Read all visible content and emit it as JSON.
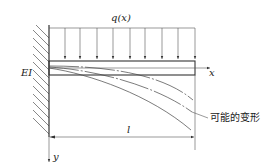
{
  "diagram": {
    "type": "cantilever-beam",
    "labels": {
      "load": "q(x)",
      "stiffness": "EI",
      "x_axis": "x",
      "y_axis": "y",
      "length": "l",
      "deformation_note": "可能的变形"
    },
    "colors": {
      "line": "#333333",
      "thin_line": "#555555",
      "background": "#ffffff"
    },
    "load_arrow_count": 9
  }
}
